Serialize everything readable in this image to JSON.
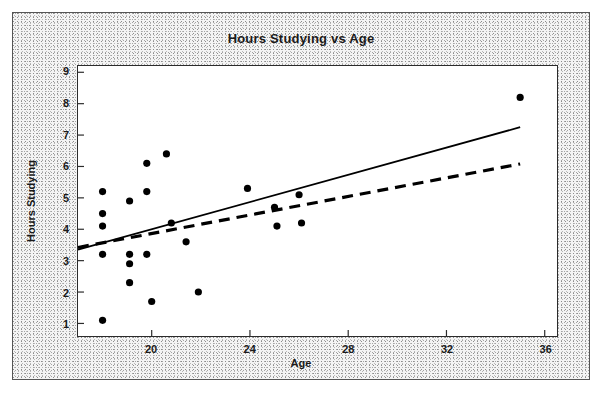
{
  "chart_data": {
    "type": "scatter",
    "title": "Hours Studying vs Age",
    "xlabel": "Age",
    "ylabel": "Hours Studying",
    "xlim": [
      17,
      36.5
    ],
    "ylim": [
      0.6,
      9.2
    ],
    "xticks": [
      20,
      24,
      28,
      32,
      36
    ],
    "yticks": [
      1,
      2,
      3,
      4,
      5,
      6,
      7,
      8,
      9
    ],
    "grid": false,
    "legend": "none",
    "marker": "filled-circle",
    "marker_color": "#000000",
    "points": [
      {
        "x": 18.0,
        "y": 5.2
      },
      {
        "x": 18.0,
        "y": 4.5
      },
      {
        "x": 18.0,
        "y": 4.1
      },
      {
        "x": 18.0,
        "y": 3.2
      },
      {
        "x": 18.0,
        "y": 1.1
      },
      {
        "x": 19.1,
        "y": 4.9
      },
      {
        "x": 19.1,
        "y": 3.2
      },
      {
        "x": 19.1,
        "y": 2.9
      },
      {
        "x": 19.1,
        "y": 2.3
      },
      {
        "x": 19.8,
        "y": 6.1
      },
      {
        "x": 19.8,
        "y": 5.2
      },
      {
        "x": 19.8,
        "y": 3.2
      },
      {
        "x": 20.0,
        "y": 1.7
      },
      {
        "x": 20.6,
        "y": 6.4
      },
      {
        "x": 20.8,
        "y": 4.2
      },
      {
        "x": 21.4,
        "y": 3.6
      },
      {
        "x": 21.9,
        "y": 2.0
      },
      {
        "x": 23.9,
        "y": 5.3
      },
      {
        "x": 25.0,
        "y": 4.7
      },
      {
        "x": 25.1,
        "y": 4.1
      },
      {
        "x": 26.0,
        "y": 5.1
      },
      {
        "x": 26.1,
        "y": 4.2
      },
      {
        "x": 35.0,
        "y": 8.2
      }
    ],
    "lines": [
      {
        "name": "regression-line-solid",
        "style": "solid",
        "color": "#000000",
        "x0": 17.0,
        "y0": 3.35,
        "x1": 35.0,
        "y1": 7.25
      },
      {
        "name": "regression-line-dashed",
        "style": "dashed",
        "color": "#000000",
        "x0": 17.0,
        "y0": 3.42,
        "x1": 35.0,
        "y1": 6.08
      }
    ]
  },
  "labels": {
    "title": "Hours Studying vs Age",
    "xaxis_title": "Age",
    "yaxis_title": "Hours Studying"
  }
}
